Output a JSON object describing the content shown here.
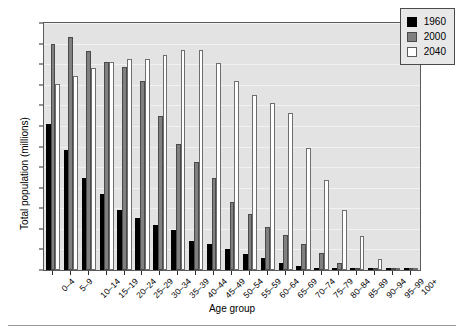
{
  "chart_data": {
    "type": "bar",
    "title": "",
    "xlabel": "Age group",
    "ylabel": "Total population (millions)",
    "ylim": [
      0,
      12
    ],
    "ytick_step": 1,
    "yticks": [
      "0",
      "1",
      "2",
      "3",
      "4",
      "5",
      "6",
      "7",
      "8",
      "9",
      "10",
      "11",
      "12"
    ],
    "grid": true,
    "legend_position": "top-right",
    "categories": [
      "0–4",
      "5–9",
      "10–14",
      "15–19",
      "20–24",
      "25–29",
      "30–34",
      "35–39",
      "40–44",
      "45–49",
      "50–54",
      "55–59",
      "60–64",
      "65–69",
      "70–74",
      "75–79",
      "80–84",
      "85–89",
      "90–94",
      "95–99",
      "100+"
    ],
    "series": [
      {
        "name": "1960",
        "color": "#000000",
        "values": [
          7.1,
          5.85,
          4.45,
          3.7,
          2.9,
          2.55,
          2.2,
          1.95,
          1.4,
          1.25,
          1.0,
          0.8,
          0.6,
          0.35,
          0.2,
          0.07,
          0.04,
          0.02,
          0.01,
          0.0,
          0.0
        ]
      },
      {
        "name": "2000",
        "color": "#808080",
        "values": [
          11.0,
          11.3,
          10.65,
          10.1,
          9.85,
          9.2,
          7.5,
          6.1,
          5.25,
          4.45,
          3.3,
          2.7,
          2.1,
          1.7,
          1.25,
          0.85,
          0.35,
          0.12,
          0.05,
          0.01,
          0.0
        ]
      },
      {
        "name": "2040",
        "color": "#ffffff",
        "values": [
          9.05,
          9.45,
          9.8,
          10.1,
          10.25,
          10.25,
          10.45,
          10.7,
          10.7,
          10.05,
          9.2,
          8.5,
          8.1,
          7.65,
          5.95,
          4.35,
          2.9,
          1.65,
          0.55,
          0.1,
          0.02
        ]
      }
    ]
  },
  "legend": {
    "entries": [
      {
        "label": "1960",
        "swatch": "series-1960-swatch"
      },
      {
        "label": "2000",
        "swatch": "series-2000-swatch"
      },
      {
        "label": "2040",
        "swatch": "series-2040-swatch"
      }
    ]
  },
  "axes": {
    "y_label": "Total population (millions)",
    "x_label": "Age group"
  }
}
